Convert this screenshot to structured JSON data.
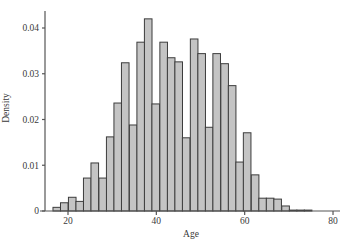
{
  "chart_data": {
    "type": "bar",
    "subtype": "histogram",
    "title": "",
    "xlabel": "Age",
    "ylabel": "Density",
    "xlim": [
      13.5,
      83
    ],
    "ylim": [
      0,
      0.0435
    ],
    "xticks": [
      20,
      40,
      60,
      80
    ],
    "yticks": [
      0,
      0.01,
      0.02,
      0.03,
      0.04
    ],
    "ytick_labels": [
      "0",
      "0.01",
      "0.02",
      "0.03",
      "0.04"
    ],
    "xtick_labels": [
      "20",
      "40",
      "60",
      "80"
    ],
    "grid": false,
    "legend": null,
    "bin_width": 1.72,
    "bin_start": 16.6,
    "bins": [
      16.6,
      18.3,
      20.1,
      21.8,
      23.5,
      25.2,
      27.0,
      28.7,
      30.4,
      32.1,
      33.9,
      35.6,
      37.3,
      39.0,
      40.8,
      42.5,
      44.2,
      45.9,
      47.7,
      49.4,
      51.1,
      52.8,
      54.6,
      56.3,
      58.0,
      59.7,
      61.5,
      63.2,
      64.9,
      66.6,
      68.4,
      70.1,
      71.8,
      73.5
    ],
    "values": [
      0.0008,
      0.0018,
      0.003,
      0.0021,
      0.0072,
      0.0105,
      0.0072,
      0.0162,
      0.0236,
      0.0324,
      0.0188,
      0.0369,
      0.042,
      0.0234,
      0.0369,
      0.0335,
      0.0326,
      0.016,
      0.0376,
      0.0344,
      0.0183,
      0.0344,
      0.0322,
      0.0274,
      0.0107,
      0.0171,
      0.0079,
      0.0028,
      0.0028,
      0.0026,
      0.0011,
      0.0002,
      0.0002,
      0.0002
    ],
    "colors": {
      "bar_fill": "#c4c4c4",
      "bar_edge": "#3c3c3c",
      "axis": "#555555"
    }
  }
}
